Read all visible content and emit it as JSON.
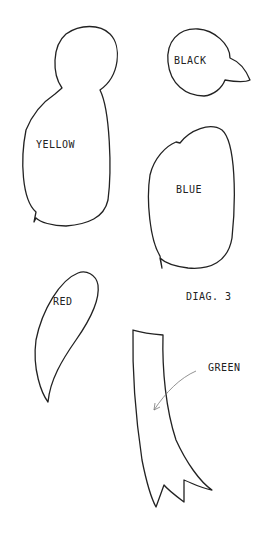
{
  "diagram": {
    "title": "DIAG. 3",
    "shapes": [
      {
        "name": "yellow-shape",
        "label": "YELLOW"
      },
      {
        "name": "black-shape",
        "label": "BLACK"
      },
      {
        "name": "blue-shape",
        "label": "BLUE"
      },
      {
        "name": "red-shape",
        "label": "RED"
      },
      {
        "name": "green-shape",
        "label": "GREEN"
      }
    ],
    "colors": {
      "stroke": "#222222",
      "arrow": "#777777",
      "background": "#ffffff"
    }
  }
}
